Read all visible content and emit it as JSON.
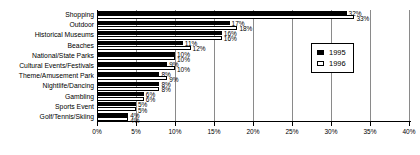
{
  "chart_data": {
    "type": "bar",
    "orientation": "horizontal",
    "title": "",
    "subtitle": "",
    "xlabel": "",
    "ylabel": "",
    "xlim": [
      0,
      40
    ],
    "xtick_labels": [
      "0%",
      "5%",
      "10%",
      "15%",
      "20%",
      "25%",
      "30%",
      "35%",
      "40%"
    ],
    "xtick_values": [
      0,
      5,
      10,
      15,
      20,
      25,
      30,
      35,
      40
    ],
    "grid": true,
    "legend_position": "upper-right",
    "categories": [
      "Shopping",
      "Outdoor",
      "Historical Museums",
      "Beaches",
      "National/State Parks",
      "Cultural Events/Festivals",
      "Theme/Amusement Park",
      "Nightlife/Dancing",
      "Gambling",
      "Sports Event",
      "Golf/Tennis/Skiing"
    ],
    "series": [
      {
        "name": "1995",
        "color": "#000000",
        "values": [
          32,
          17,
          16,
          11,
          10,
          9,
          8,
          8,
          6,
          5,
          4
        ],
        "labels": [
          "32%",
          "17%",
          "16%",
          "11%",
          "10%",
          "9%",
          "8%",
          "8%",
          "6%",
          "5%",
          "4%"
        ]
      },
      {
        "name": "1996",
        "color": "#ffffff",
        "values": [
          33,
          18,
          16,
          12,
          10,
          10,
          9,
          8,
          6,
          5,
          4
        ],
        "labels": [
          "33%",
          "18%",
          "16%",
          "12%",
          "10%",
          "10%",
          "9%",
          "8%",
          "6%",
          "5%",
          "4%"
        ]
      }
    ]
  },
  "legend": {
    "items": [
      {
        "label": "1995"
      },
      {
        "label": "1996"
      }
    ]
  }
}
